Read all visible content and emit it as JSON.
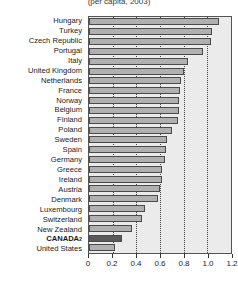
{
  "chart_data": {
    "type": "bar",
    "orientation": "horizontal",
    "title": "(per capita, 2003)",
    "xlabel": "",
    "ylabel": "",
    "xlim": [
      0,
      1.2
    ],
    "xticks": [
      0,
      0.2,
      0.4,
      0.6,
      0.8,
      1.0,
      1.2
    ],
    "xtick_labels": [
      "0",
      "0.2",
      "0.4",
      "0.6",
      "0.8",
      "1.0",
      "1.2"
    ],
    "grid": true,
    "grid_axis": "x",
    "legend": false,
    "highlight_category": "CANADA",
    "highlight_color": "#5a5a5a",
    "bar_color": "#b0b0b0",
    "categories": [
      "Hungary",
      "Turkey",
      "Czech Republic",
      "Portugal",
      "Italy",
      "United Kingdom",
      "Netherlands",
      "France",
      "Norway",
      "Belgium",
      "Finland",
      "Poland",
      "Sweden",
      "Spain",
      "Germany",
      "Greece",
      "Ireland",
      "Austria",
      "Denmark",
      "Luxembourg",
      "Switzerland",
      "New Zealand",
      "CANADA",
      "United States"
    ],
    "category_superscripts": {
      "CANADA": "2"
    },
    "values": [
      1.1,
      1.04,
      1.03,
      0.96,
      0.84,
      0.8,
      0.78,
      0.77,
      0.76,
      0.76,
      0.75,
      0.7,
      0.66,
      0.65,
      0.64,
      0.62,
      0.62,
      0.6,
      0.58,
      0.47,
      0.45,
      0.36,
      0.28,
      0.22
    ]
  },
  "axis": {
    "tick_labels": [
      "0",
      "0.2",
      "0.4",
      "0.6",
      "0.8",
      "1.0",
      "1.2"
    ]
  }
}
